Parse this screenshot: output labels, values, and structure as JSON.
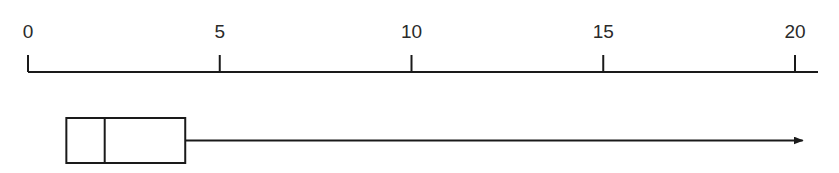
{
  "chart_data": {
    "type": "boxplot",
    "title": "",
    "xlabel": "",
    "ylabel": "",
    "xlim": [
      0,
      20
    ],
    "ticks": [
      0,
      5,
      10,
      15,
      20
    ],
    "tick_labels": [
      "0",
      "5",
      "10",
      "15",
      "20"
    ],
    "grid": false,
    "box": {
      "q1": 1,
      "median": 2,
      "q3": 4.1,
      "whisker_low": null,
      "whisker_high_arrow_to": 20.2,
      "note": "Right whisker drawn as an arrow extending beyond 20; no left whisker"
    }
  },
  "colors": {
    "stroke": "#1a1a1a",
    "background": "#ffffff"
  }
}
